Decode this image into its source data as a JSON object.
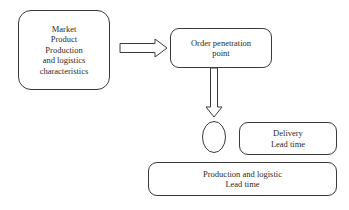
{
  "diagram": {
    "background_color": "#ffffff",
    "stroke_color": "#3a3a3a",
    "text_color": "#2b2b2b",
    "nodes": [
      {
        "id": "characteristics",
        "label": "Market\nProduct\nProduction\nand logistics\ncharacteristics",
        "shape": "rounded-rect"
      },
      {
        "id": "order_penetration_point",
        "label": "Order penetration\npoint",
        "shape": "rounded-rect"
      },
      {
        "id": "delivery_lead_time",
        "label": "Delivery\nLead time",
        "shape": "rounded-rect"
      },
      {
        "id": "production_logistic_lead_time",
        "label": "Production and logistic\nLead time",
        "shape": "rounded-rect"
      },
      {
        "id": "junction",
        "label": "",
        "shape": "ellipse"
      }
    ],
    "connectors": [
      {
        "id": "characteristics-to-opp",
        "style": "hollow-block-arrow",
        "direction": "right"
      },
      {
        "id": "opp-to-junction",
        "style": "hollow-block-arrow",
        "direction": "down"
      }
    ]
  }
}
